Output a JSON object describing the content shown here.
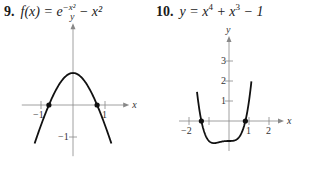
{
  "problems": [
    {
      "number": "9.",
      "lhs": "f(x) = e",
      "exp": "−x²",
      "rest": " − x²"
    },
    {
      "number": "10.",
      "lhs": "y = x",
      "exp1": "4",
      "mid": " + x",
      "exp2": "3",
      "rest": " − 1"
    }
  ],
  "chart_data": [
    {
      "type": "line",
      "title": "f(x) = e^(-x^2) - x^2",
      "function": "exp(-x*x) - x*x",
      "xlabel": "x",
      "ylabel": "y",
      "xlim": [
        -1.6,
        1.6
      ],
      "ylim": [
        -1.6,
        2.4
      ],
      "x_ticks": [
        -1,
        1
      ],
      "y_ticks": [
        -1
      ],
      "x_tick_labels": [
        "−1",
        "1"
      ],
      "y_tick_labels": [
        "−1"
      ],
      "domain": [
        -1.2,
        1.2
      ],
      "marked_points": [
        [
          -0.753,
          0
        ],
        [
          0.753,
          0
        ]
      ],
      "origin_px": [
        73,
        105
      ],
      "unit_px": [
        32,
        32
      ]
    },
    {
      "type": "line",
      "title": "y = x^4 + x^3 - 1",
      "function": "x^4 + x^3 - 1",
      "xlabel": "x",
      "ylabel": "y",
      "xlim": [
        -2.5,
        2.5
      ],
      "ylim": [
        -1.5,
        4
      ],
      "x_ticks": [
        -2,
        -1,
        1,
        2
      ],
      "y_ticks": [
        1,
        2,
        3
      ],
      "x_tick_labels": [
        "−2",
        "",
        "1",
        "2"
      ],
      "y_tick_labels": [
        "1",
        "2",
        "3"
      ],
      "domain": [
        -1.6,
        1.12
      ],
      "marked_points": [
        [
          -1.381,
          0
        ],
        [
          0.819,
          0
        ]
      ],
      "origin_px": [
        229,
        121
      ],
      "unit_px": [
        20,
        20
      ]
    }
  ]
}
